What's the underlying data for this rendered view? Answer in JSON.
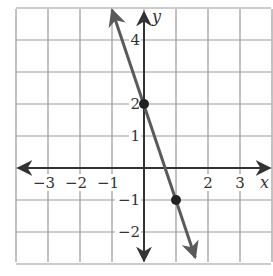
{
  "chart_data": {
    "type": "line",
    "title": "",
    "xlabel": "x",
    "ylabel": "y",
    "xlim": [
      -4,
      4
    ],
    "ylim": [
      -3,
      5
    ],
    "grid": true,
    "x_ticks": [
      {
        "value": -3,
        "label": "−3"
      },
      {
        "value": -2,
        "label": "−2"
      },
      {
        "value": -1,
        "label": "−1"
      },
      {
        "value": 2,
        "label": "2"
      },
      {
        "value": 3,
        "label": "3"
      }
    ],
    "y_ticks": [
      {
        "value": 4,
        "label": "4"
      },
      {
        "value": 2,
        "label": "2"
      },
      {
        "value": 1,
        "label": "1"
      },
      {
        "value": -1,
        "label": "−1"
      },
      {
        "value": -2,
        "label": "−2"
      }
    ],
    "series": [
      {
        "name": "line",
        "equation": "y = -3x + 2",
        "slope": -3,
        "intercept": 2,
        "x": [
          -1,
          1.6
        ],
        "y": [
          5,
          -2.8
        ],
        "color": "#555555",
        "arrows": "both"
      }
    ],
    "points": [
      {
        "x": 0,
        "y": 2
      },
      {
        "x": 1,
        "y": -1
      }
    ]
  },
  "colors": {
    "grid": "#999999",
    "axis": "#333333",
    "line": "#5a5a5a",
    "point": "#222222"
  }
}
